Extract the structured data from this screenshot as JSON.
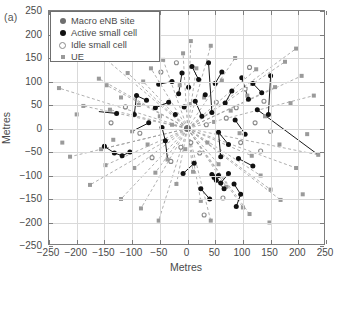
{
  "figure": {
    "panel_a_tag": "(a)",
    "panel_b_tag": "(b)",
    "panel_b_first_ytick": "250"
  },
  "legend": {
    "items": [
      {
        "label": "Macro eNB site",
        "marker": "filled-circle-gray",
        "color": "#6e6e6e"
      },
      {
        "label": "Active small cell",
        "marker": "filled-circle-black",
        "color": "#111111"
      },
      {
        "label": "Idle small cell",
        "marker": "open-circle-gray",
        "color": "#8a8a8a"
      },
      {
        "label": "UE",
        "marker": "filled-square-gray",
        "color": "#9a9a9a"
      }
    ]
  },
  "chart_data": {
    "type": "scatter",
    "title": "",
    "xlabel": "Metres",
    "ylabel": "Metres",
    "xlim": [
      -250,
      250
    ],
    "ylim": [
      -250,
      250
    ],
    "xticks": [
      -250,
      -200,
      -150,
      -100,
      -50,
      0,
      50,
      100,
      150,
      200,
      250
    ],
    "yticks": [
      -250,
      -200,
      -150,
      -100,
      -50,
      0,
      50,
      100,
      150,
      200,
      250
    ],
    "xticklabels": [
      "-250",
      "-200",
      "-150",
      "-100",
      "-50",
      "0",
      "50",
      "100",
      "150",
      "200",
      "250"
    ],
    "yticklabels": [
      "-250",
      "-200",
      "-150",
      "-100",
      "-50",
      "0",
      "50",
      "100",
      "150",
      "200",
      "250"
    ],
    "grid": true,
    "legend_position": "upper-left",
    "series": [
      {
        "name": "Macro eNB site",
        "marker": "circle",
        "color": "#6e6e6e",
        "size": 7,
        "points": [
          [
            0,
            0
          ]
        ]
      },
      {
        "name": "Active small cell",
        "marker": "circle-filled",
        "color": "#111111",
        "size": 5,
        "points": [
          [
            -128,
            32
          ],
          [
            -150,
            -38
          ],
          [
            -132,
            -52
          ],
          [
            -118,
            -58
          ],
          [
            -104,
            -50
          ],
          [
            -96,
            30
          ],
          [
            -92,
            70
          ],
          [
            -74,
            60
          ],
          [
            -70,
            12
          ],
          [
            -58,
            44
          ],
          [
            -52,
            94
          ],
          [
            -46,
            2
          ],
          [
            -40,
            -26
          ],
          [
            -34,
            56
          ],
          [
            -28,
            100
          ],
          [
            -22,
            30
          ],
          [
            -16,
            74
          ],
          [
            -10,
            118
          ],
          [
            -6,
            46
          ],
          [
            2,
            88
          ],
          [
            8,
            132
          ],
          [
            14,
            58
          ],
          [
            20,
            104
          ],
          [
            26,
            26
          ],
          [
            32,
            72
          ],
          [
            38,
            140
          ],
          [
            44,
            34
          ],
          [
            50,
            96
          ],
          [
            56,
            -8
          ],
          [
            62,
            120
          ],
          [
            68,
            54
          ],
          [
            74,
            -34
          ],
          [
            80,
            80
          ],
          [
            86,
            18
          ],
          [
            92,
            -64
          ],
          [
            98,
            108
          ],
          [
            104,
            -12
          ],
          [
            110,
            62
          ],
          [
            118,
            -80
          ],
          [
            126,
            40
          ],
          [
            44,
            -98
          ],
          [
            48,
            -104
          ],
          [
            52,
            -110
          ],
          [
            56,
            -100
          ],
          [
            60,
            -116
          ],
          [
            66,
            -128
          ],
          [
            74,
            -96
          ],
          [
            84,
            -118
          ],
          [
            96,
            -140
          ],
          [
            60,
            -60
          ],
          [
            118,
            96
          ],
          [
            134,
            76
          ],
          [
            146,
            30
          ],
          [
            150,
            112
          ],
          [
            40,
            -150
          ],
          [
            -8,
            -96
          ],
          [
            12,
            -74
          ],
          [
            24,
            -128
          ],
          [
            88,
            -166
          ]
        ]
      },
      {
        "name": "Idle small cell",
        "marker": "circle-open",
        "color": "#8a8a8a",
        "size": 4,
        "points": [
          [
            -138,
            12
          ],
          [
            -112,
            46
          ],
          [
            -86,
            -10
          ],
          [
            -64,
            -62
          ],
          [
            -48,
            120
          ],
          [
            -30,
            -70
          ],
          [
            -12,
            -40
          ],
          [
            6,
            -30
          ],
          [
            22,
            -52
          ],
          [
            34,
            8
          ],
          [
            52,
            56
          ],
          [
            70,
            22
          ],
          [
            88,
            44
          ],
          [
            104,
            84
          ],
          [
            122,
            12
          ],
          [
            138,
            58
          ],
          [
            96,
            -30
          ],
          [
            64,
            -148
          ],
          [
            30,
            -184
          ],
          [
            -20,
            140
          ],
          [
            112,
            130
          ],
          [
            132,
            -48
          ],
          [
            150,
            -6
          ]
        ]
      },
      {
        "name": "UE",
        "marker": "square",
        "color": "#9a9a9a",
        "size": 4,
        "points": [
          [
            -160,
            106
          ],
          [
            -146,
            92
          ],
          [
            -140,
            40
          ],
          [
            -156,
            -44
          ],
          [
            -148,
            -78
          ],
          [
            -134,
            -24
          ],
          [
            -120,
            66
          ],
          [
            -108,
            118
          ],
          [
            -100,
            -6
          ],
          [
            -96,
            -84
          ],
          [
            -88,
            50
          ],
          [
            -80,
            100
          ],
          [
            -72,
            -34
          ],
          [
            -66,
            128
          ],
          [
            -58,
            -94
          ],
          [
            -50,
            26
          ],
          [
            -44,
            146
          ],
          [
            -36,
            -66
          ],
          [
            -28,
            8
          ],
          [
            -20,
            -118
          ],
          [
            -14,
            92
          ],
          [
            -8,
            160
          ],
          [
            -4,
            -44
          ],
          [
            4,
            52
          ],
          [
            10,
            -92
          ],
          [
            16,
            128
          ],
          [
            24,
            -154
          ],
          [
            30,
            66
          ],
          [
            36,
            -30
          ],
          [
            42,
            176
          ],
          [
            48,
            14
          ],
          [
            56,
            -76
          ],
          [
            62,
            102
          ],
          [
            70,
            -124
          ],
          [
            78,
            38
          ],
          [
            86,
            150
          ],
          [
            94,
            -10
          ],
          [
            100,
            -168
          ],
          [
            108,
            70
          ],
          [
            116,
            -58
          ],
          [
            124,
            126
          ],
          [
            132,
            -100
          ],
          [
            140,
            26
          ],
          [
            150,
            -130
          ],
          [
            158,
            88
          ],
          [
            166,
            -34
          ],
          [
            176,
            142
          ],
          [
            186,
            54
          ],
          [
            196,
            -84
          ],
          [
            206,
            112
          ],
          [
            216,
            -12
          ],
          [
            228,
            70
          ],
          [
            236,
            -56
          ],
          [
            -188,
            48
          ],
          [
            -176,
            -120
          ],
          [
            -200,
            30
          ],
          [
            -212,
            -60
          ],
          [
            -168,
            168
          ],
          [
            -120,
            -150
          ],
          [
            -84,
            -170
          ],
          [
            -52,
            -196
          ],
          [
            42,
            -196
          ],
          [
            112,
            -182
          ],
          [
            148,
            -200
          ],
          [
            196,
            170
          ],
          [
            168,
            -152
          ],
          [
            208,
            -140
          ],
          [
            -232,
            86
          ],
          [
            -226,
            -30
          ],
          [
            6,
            186
          ]
        ]
      }
    ],
    "links_macro_dashed": {
      "style": "dashed",
      "color": "#9a9a9a",
      "description": "UE associations to the macro eNB at the origin",
      "from": [
        0,
        0
      ],
      "to": [
        [
          -160,
          106
        ],
        [
          -146,
          92
        ],
        [
          -140,
          40
        ],
        [
          -156,
          -44
        ],
        [
          -148,
          -78
        ],
        [
          -108,
          118
        ],
        [
          -96,
          -84
        ],
        [
          -80,
          100
        ],
        [
          -66,
          128
        ],
        [
          -58,
          -94
        ],
        [
          -44,
          146
        ],
        [
          -20,
          -118
        ],
        [
          -8,
          160
        ],
        [
          10,
          -92
        ],
        [
          16,
          128
        ],
        [
          24,
          -154
        ],
        [
          42,
          176
        ],
        [
          56,
          -76
        ],
        [
          70,
          -124
        ],
        [
          86,
          150
        ],
        [
          100,
          -168
        ],
        [
          116,
          -58
        ],
        [
          124,
          126
        ],
        [
          132,
          -100
        ],
        [
          150,
          -130
        ],
        [
          158,
          88
        ],
        [
          176,
          142
        ],
        [
          196,
          -84
        ],
        [
          206,
          112
        ],
        [
          228,
          70
        ],
        [
          -188,
          48
        ],
        [
          -176,
          -120
        ],
        [
          -212,
          -60
        ],
        [
          -168,
          168
        ],
        [
          -120,
          -150
        ],
        [
          -84,
          -170
        ],
        [
          -52,
          -196
        ],
        [
          42,
          -196
        ],
        [
          112,
          -182
        ],
        [
          196,
          170
        ],
        [
          168,
          -152
        ],
        [
          -232,
          86
        ],
        [
          6,
          186
        ],
        [
          236,
          -56
        ]
      ]
    },
    "links_small_cell_solid": {
      "style": "solid",
      "color": "#1a1a1a",
      "description": "UE associations to active small cells",
      "edges": [
        [
          [
            -128,
            32
          ],
          [
            -160,
            36
          ]
        ],
        [
          [
            -150,
            -38
          ],
          [
            -132,
            -52
          ]
        ],
        [
          [
            -132,
            -52
          ],
          [
            -118,
            -58
          ]
        ],
        [
          [
            -104,
            -50
          ],
          [
            -118,
            -58
          ]
        ],
        [
          [
            -96,
            30
          ],
          [
            -92,
            70
          ]
        ],
        [
          [
            -92,
            70
          ],
          [
            -74,
            60
          ]
        ],
        [
          [
            -70,
            12
          ],
          [
            -100,
            -6
          ]
        ],
        [
          [
            -58,
            44
          ],
          [
            -34,
            56
          ]
        ],
        [
          [
            -52,
            94
          ],
          [
            -28,
            100
          ]
        ],
        [
          [
            -46,
            2
          ],
          [
            -40,
            -26
          ]
        ],
        [
          [
            -40,
            -26
          ],
          [
            -36,
            -66
          ]
        ],
        [
          [
            -16,
            74
          ],
          [
            -10,
            118
          ]
        ],
        [
          [
            8,
            132
          ],
          [
            20,
            104
          ]
        ],
        [
          [
            14,
            58
          ],
          [
            26,
            26
          ]
        ],
        [
          [
            38,
            140
          ],
          [
            44,
            34
          ]
        ],
        [
          [
            50,
            96
          ],
          [
            62,
            120
          ]
        ],
        [
          [
            56,
            -8
          ],
          [
            74,
            -34
          ]
        ],
        [
          [
            68,
            54
          ],
          [
            80,
            80
          ]
        ],
        [
          [
            86,
            18
          ],
          [
            104,
            -12
          ]
        ],
        [
          [
            92,
            -64
          ],
          [
            118,
            -80
          ]
        ],
        [
          [
            98,
            108
          ],
          [
            110,
            62
          ]
        ],
        [
          [
            126,
            40
          ],
          [
            236,
            -56
          ]
        ],
        [
          [
            118,
            96
          ],
          [
            134,
            76
          ]
        ],
        [
          [
            146,
            30
          ],
          [
            150,
            112
          ]
        ],
        [
          [
            44,
            -98
          ],
          [
            56,
            -100
          ]
        ],
        [
          [
            52,
            -110
          ],
          [
            66,
            -128
          ]
        ],
        [
          [
            60,
            -116
          ],
          [
            74,
            -96
          ]
        ],
        [
          [
            84,
            -118
          ],
          [
            96,
            -140
          ]
        ],
        [
          [
            96,
            -140
          ],
          [
            88,
            -166
          ]
        ],
        [
          [
            40,
            -150
          ],
          [
            24,
            -128
          ]
        ],
        [
          [
            -8,
            -96
          ],
          [
            12,
            -74
          ]
        ],
        [
          [
            60,
            -60
          ],
          [
            56,
            -8
          ]
        ]
      ]
    }
  }
}
